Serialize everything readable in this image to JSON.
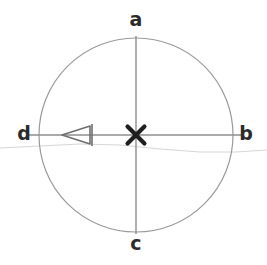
{
  "figure": {
    "background_color": "#ffffff",
    "width": 267,
    "height": 265
  },
  "circle": {
    "name": "circle-outline",
    "center_x": 136,
    "center_y": 135,
    "radius": 97,
    "stroke_color": "#9a9a9a",
    "stroke_width": 1.2,
    "fill": "none"
  },
  "axes": {
    "vertical": {
      "name": "vertical-diameter",
      "x1": 136,
      "y1": 36,
      "x2": 136,
      "y2": 234,
      "stroke_color": "#8e8e8e",
      "stroke_width": 1.4
    },
    "horizontal": {
      "name": "horizontal-diameter",
      "x1": 28,
      "y1": 135,
      "x2": 244,
      "y2": 135,
      "stroke_color": "#8e8e8e",
      "stroke_width": 1.4
    }
  },
  "center_marker": {
    "name": "center-x-marker",
    "symbol": "X",
    "x": 136,
    "y": 135,
    "color": "#1f1f1f",
    "size": 22
  },
  "arrow_marker": {
    "name": "left-arrow-marker",
    "description": "left-pointing arrowhead with vertical tail bar on horizontal axis",
    "tip_x": 62,
    "tail_x": 90,
    "y": 135,
    "half_height": 9,
    "color": "#6e6e6e",
    "stroke_width": 1.6,
    "direction": "left"
  },
  "faint_curve": {
    "name": "faint-horizon-curve",
    "stroke_color": "#d6d6d6",
    "stroke_width": 1.0,
    "points": "0,148 40,146 80,144 120,145 160,149 200,152 236,152 267,150"
  },
  "labels": {
    "top": "a",
    "right": "b",
    "bottom": "c",
    "left": "d"
  }
}
